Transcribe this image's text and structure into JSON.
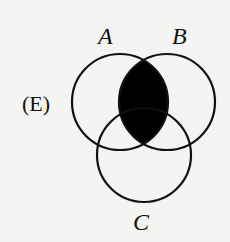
{
  "diagram": {
    "option_label": "(E)",
    "sets": [
      {
        "name": "A",
        "cx": 120,
        "cy": 102,
        "r": 48
      },
      {
        "name": "B",
        "cx": 167,
        "cy": 102,
        "r": 48
      },
      {
        "name": "C",
        "cx": 144,
        "cy": 155,
        "r": 47
      }
    ],
    "shaded_region": "A ∩ B",
    "colors": {
      "stroke": "#111111",
      "fill": "#000000",
      "background": "#f4f4f2"
    }
  }
}
